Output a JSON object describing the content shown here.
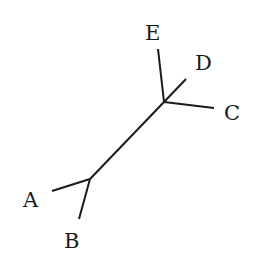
{
  "diagram": {
    "type": "unrooted-phylogenetic-tree",
    "leaves": [
      {
        "id": "A",
        "label": "A"
      },
      {
        "id": "B",
        "label": "B"
      },
      {
        "id": "C",
        "label": "C"
      },
      {
        "id": "D",
        "label": "D"
      },
      {
        "id": "E",
        "label": "E"
      }
    ],
    "internal_nodes": [
      "n1",
      "n2"
    ],
    "edges": [
      {
        "from": "n1",
        "to": "A"
      },
      {
        "from": "n1",
        "to": "B"
      },
      {
        "from": "n1",
        "to": "n2"
      },
      {
        "from": "n2",
        "to": "C"
      },
      {
        "from": "n2",
        "to": "D"
      },
      {
        "from": "n2",
        "to": "E"
      }
    ],
    "line_color": "#1a1a1a",
    "background": "#ffffff"
  }
}
